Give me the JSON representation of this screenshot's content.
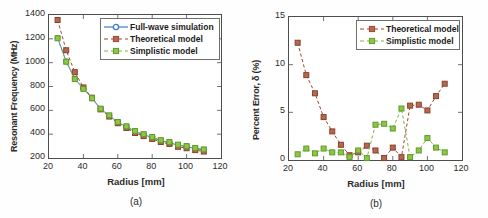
{
  "figure": {
    "background": "#fefefe",
    "panels": [
      {
        "id": "a",
        "caption": "(a)",
        "legend_position": "top-right"
      },
      {
        "id": "b",
        "caption": "(b)",
        "legend_position": "top-right"
      }
    ]
  },
  "chart_data": [
    {
      "type": "line",
      "panel": "a",
      "title": "",
      "xlabel": "Radius [mm]",
      "ylabel": "Resonant Frequency (MHz)",
      "xlim": [
        20,
        120
      ],
      "ylim": [
        200,
        1400
      ],
      "xticks": [
        20,
        40,
        60,
        80,
        100,
        120
      ],
      "yticks": [
        200,
        400,
        600,
        800,
        1000,
        1200,
        1400
      ],
      "grid": false,
      "legend": [
        "Full-wave simulation",
        "Theoretical model",
        "Simplistic model"
      ],
      "x": [
        25,
        30,
        35,
        40,
        45,
        50,
        55,
        60,
        65,
        70,
        75,
        80,
        85,
        90,
        95,
        100,
        105,
        110
      ],
      "series": [
        {
          "name": "Full-wave simulation",
          "color": "#3d7ec4",
          "marker": "circle",
          "linestyle": "solid",
          "values": [
            1208,
            1010,
            866,
            782,
            700,
            612,
            556,
            500,
            462,
            420,
            396,
            372,
            344,
            330,
            306,
            296,
            278,
            268
          ]
        },
        {
          "name": "Theoretical model",
          "color": "#a0472f",
          "marker": "square",
          "linestyle": "dashed",
          "values": [
            1358,
            1104,
            920,
            792,
            706,
            608,
            548,
            492,
            452,
            410,
            384,
            360,
            334,
            318,
            294,
            282,
            266,
            254
          ]
        },
        {
          "name": "Simplistic model",
          "color": "#7ab648",
          "marker": "square",
          "linestyle": "dashed",
          "values": [
            1205,
            1008,
            862,
            780,
            702,
            614,
            558,
            502,
            466,
            426,
            400,
            376,
            350,
            334,
            312,
            300,
            284,
            272
          ]
        }
      ]
    },
    {
      "type": "line",
      "panel": "b",
      "title": "",
      "xlabel": "Radius [mm]",
      "ylabel": "Percent Error, δ (%)",
      "xlim": [
        20,
        120
      ],
      "ylim": [
        0,
        15
      ],
      "xticks": [
        20,
        40,
        60,
        80,
        100,
        120
      ],
      "yticks": [
        0,
        5,
        10,
        15
      ],
      "grid": false,
      "legend": [
        "Theoretical model",
        "Simplistic model"
      ],
      "x": [
        25,
        30,
        35,
        40,
        45,
        50,
        55,
        60,
        65,
        70,
        75,
        80,
        85,
        90,
        95,
        100,
        105,
        110
      ],
      "series": [
        {
          "name": "Theoretical model",
          "color": "#a0472f",
          "marker": "square",
          "linestyle": "dashed",
          "values": [
            12.3,
            8.9,
            7.0,
            4.5,
            3.0,
            1.6,
            0.5,
            0.8,
            1.5,
            1.0,
            0.2,
            1.3,
            0.3,
            5.7,
            5.8,
            5.2,
            6.7,
            8.0
          ]
        },
        {
          "name": "Simplistic model",
          "color": "#7ab648",
          "marker": "square",
          "linestyle": "dashed",
          "values": [
            0.6,
            1.2,
            0.7,
            1.2,
            0.8,
            0.8,
            0.3,
            1.0,
            0.2,
            3.7,
            3.8,
            3.3,
            5.4,
            0.3,
            1.0,
            2.3,
            1.3,
            0.8
          ]
        }
      ]
    }
  ]
}
